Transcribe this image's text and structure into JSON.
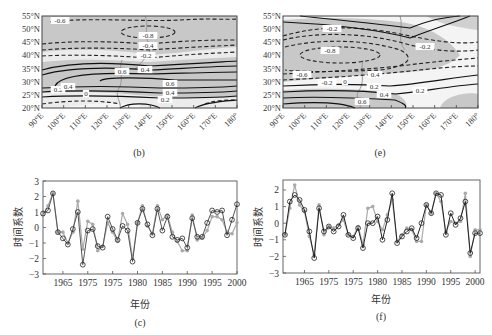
{
  "panels": {
    "b": {
      "caption": "(b)",
      "frame": {
        "x": 42,
        "y": 16,
        "w": 195,
        "h": 92
      },
      "lat_ticks": [
        "55°N",
        "50°N",
        "45°N",
        "40°N",
        "35°N",
        "30°N",
        "25°N",
        "20°N"
      ],
      "lon_ticks": [
        "90°E",
        "100°E",
        "110°E",
        "120°E",
        "130°E",
        "140°E",
        "150°E",
        "160°E",
        "170°E",
        "180°"
      ],
      "contour_labels": [
        {
          "text": "-0.6",
          "x": 60,
          "y": 22
        },
        {
          "text": "-0.8",
          "x": 148,
          "y": 37
        },
        {
          "text": "-0.4",
          "x": 148,
          "y": 47
        },
        {
          "text": "-0.2",
          "x": 146,
          "y": 57
        },
        {
          "text": "0.6",
          "x": 122,
          "y": 73
        },
        {
          "text": "0.4",
          "x": 145,
          "y": 71
        },
        {
          "text": "0.6",
          "x": 170,
          "y": 85
        },
        {
          "text": "0.4",
          "x": 170,
          "y": 94
        },
        {
          "text": "0.2",
          "x": 165,
          "y": 101
        },
        {
          "text": "0.2",
          "x": 58,
          "y": 91
        },
        {
          "text": "0.4",
          "x": 68,
          "y": 88
        },
        {
          "text": "0",
          "x": 86,
          "y": 95
        }
      ]
    },
    "e": {
      "caption": "(e)",
      "frame": {
        "x": 283,
        "y": 16,
        "w": 195,
        "h": 92
      },
      "lat_ticks": [
        "55°N",
        "50°N",
        "45°N",
        "40°N",
        "35°N",
        "30°N",
        "25°N",
        "20°N"
      ],
      "lon_ticks": [
        "90°E",
        "100°E",
        "110°E",
        "120°E",
        "130°E",
        "140°E",
        "150°E",
        "160°E",
        "170°E",
        "180°"
      ],
      "contour_labels": [
        {
          "text": "-0.2",
          "x": 332,
          "y": 30
        },
        {
          "text": "-0.2",
          "x": 425,
          "y": 48
        },
        {
          "text": "-0.8",
          "x": 330,
          "y": 52
        },
        {
          "text": "-0.6",
          "x": 302,
          "y": 76
        },
        {
          "text": "-0.2",
          "x": 327,
          "y": 84
        },
        {
          "text": "0",
          "x": 345,
          "y": 83
        },
        {
          "text": "0.4",
          "x": 375,
          "y": 76
        },
        {
          "text": "0.2",
          "x": 374,
          "y": 88
        },
        {
          "text": "0.4",
          "x": 384,
          "y": 96
        },
        {
          "text": "0.2",
          "x": 420,
          "y": 92
        },
        {
          "text": "0.6",
          "x": 362,
          "y": 103
        }
      ]
    },
    "c": {
      "caption": "(c)",
      "ylabel": "时间系数",
      "xlabel": "年份",
      "frame": {
        "x": 43,
        "y": 181,
        "w": 194,
        "h": 93
      },
      "xtick_labels": [
        "1965",
        "1975",
        "1975",
        "1980",
        "1985",
        "1990",
        "1995",
        "2000"
      ],
      "ytick_labels": [
        "3",
        "2",
        "1",
        "0",
        "−1",
        "−2",
        "−3"
      ]
    },
    "f": {
      "caption": "(f)",
      "ylabel": "时间系数",
      "xlabel": "年份",
      "frame": {
        "x": 283,
        "y": 180,
        "w": 197,
        "h": 93
      },
      "xtick_labels": [
        "1965",
        "1975",
        "1975",
        "1980",
        "1985",
        "1990",
        "1995",
        "2000"
      ],
      "ytick_labels": [
        "2",
        "1",
        "0",
        "−1",
        "−2",
        "−3"
      ]
    }
  },
  "chart_data": [
    {
      "type": "contour-map",
      "panel": "b",
      "title": "(b)",
      "xlabel": "",
      "ylabel": "",
      "x_range": [
        "90°E",
        "180°"
      ],
      "y_range": [
        "20°N",
        "55°N"
      ],
      "contour_levels": [
        -0.8,
        -0.6,
        -0.4,
        -0.2,
        0,
        0.2,
        0.4,
        0.6
      ],
      "notes": "Negative dashed contours north of ~40°N (min -0.8 near 130°E,50°N); positive solid contours band 25–35°N (max 0.6); shading marks significant regions"
    },
    {
      "type": "contour-map",
      "panel": "e",
      "title": "(e)",
      "x_range": [
        "90°E",
        "180°"
      ],
      "y_range": [
        "20°N",
        "55°N"
      ],
      "contour_levels": [
        -0.8,
        -0.6,
        -0.4,
        -0.2,
        0,
        0.2,
        0.4,
        0.6
      ],
      "notes": "Negative dashed centre -0.8 near 110°E,38°N; positive solid contours south of 30°N (0.2–0.6); shaded significant areas"
    },
    {
      "type": "line",
      "panel": "c",
      "title": "(c)",
      "xlabel": "年份",
      "ylabel": "时间系数",
      "xtick_labels": [
        "1965",
        "1975",
        "1975",
        "1980",
        "1985",
        "1990",
        "1995",
        "2000"
      ],
      "ylim": [
        -3,
        3
      ],
      "x": [
        1961,
        1962,
        1963,
        1964,
        1965,
        1966,
        1967,
        1968,
        1969,
        1970,
        1971,
        1972,
        1973,
        1974,
        1975,
        1976,
        1977,
        1978,
        1979,
        1980,
        1981,
        1982,
        1983,
        1984,
        1985,
        1986,
        1987,
        1988,
        1989,
        1990,
        1991,
        1992,
        1993,
        1994,
        1995,
        1996,
        1997,
        1998,
        1999,
        2000
      ],
      "series": [
        {
          "name": "black-open-circles",
          "values": [
            0.9,
            1.1,
            2.2,
            -0.3,
            -0.7,
            -1.1,
            -0.1,
            1.0,
            -2.4,
            -0.2,
            -0.1,
            -1.2,
            -1.3,
            0.7,
            -0.1,
            -0.8,
            0.1,
            -0.2,
            -2.2,
            0.3,
            1.2,
            0.2,
            -0.5,
            1.2,
            -0.2,
            0.7,
            -0.6,
            -0.8,
            -0.7,
            -1.3,
            0.6,
            -0.6,
            -0.6,
            0.3,
            1.1,
            1.0,
            1.1,
            -0.5,
            0.5,
            1.5
          ]
        },
        {
          "name": "gray-filled-circles",
          "values": [
            0.8,
            1.4,
            2.2,
            -0.3,
            -0.3,
            -1.0,
            -0.3,
            1.7,
            -1.4,
            0.4,
            0.2,
            -1.5,
            -1.2,
            0.3,
            -0.3,
            -0.9,
            0.9,
            0.2,
            -2.0,
            0.3,
            1.4,
            0.1,
            -0.4,
            1.4,
            0.5,
            0.8,
            -0.3,
            -0.9,
            -1.5,
            -1.5,
            0.8,
            -0.8,
            -0.7,
            -0.2,
            0.7,
            0.7,
            0.5,
            -0.3,
            -0.4,
            0.3
          ]
        }
      ]
    },
    {
      "type": "line",
      "panel": "f",
      "title": "(f)",
      "xlabel": "年份",
      "ylabel": "时间系数",
      "xtick_labels": [
        "1965",
        "1975",
        "1975",
        "1980",
        "1985",
        "1990",
        "1995",
        "2000"
      ],
      "ylim": [
        -3,
        2.6
      ],
      "x": [
        1961,
        1962,
        1963,
        1964,
        1965,
        1966,
        1967,
        1968,
        1969,
        1970,
        1971,
        1972,
        1973,
        1974,
        1975,
        1976,
        1977,
        1978,
        1979,
        1980,
        1981,
        1982,
        1983,
        1984,
        1985,
        1986,
        1987,
        1988,
        1989,
        1990,
        1991,
        1992,
        1993,
        1994,
        1995,
        1996,
        1997,
        1998,
        1999,
        2000,
        2001
      ],
      "series": [
        {
          "name": "black-open-circles",
          "values": [
            -0.7,
            1.3,
            1.7,
            1.4,
            0.8,
            -0.5,
            -2.1,
            0.9,
            -0.5,
            -0.2,
            -0.5,
            -0.2,
            0.5,
            -0.7,
            -0.9,
            -0.3,
            -1.5,
            0.0,
            0.0,
            0.4,
            -1.0,
            0.2,
            1.8,
            -1.2,
            -0.8,
            -0.5,
            -0.3,
            -0.9,
            0.0,
            1.1,
            0.6,
            1.8,
            1.7,
            -0.7,
            0.6,
            -0.1,
            0.3,
            1.3,
            -1.8,
            -0.6,
            -0.6
          ]
        },
        {
          "name": "gray-filled-circles",
          "values": [
            -0.7,
            0.9,
            2.3,
            1.1,
            0.7,
            -0.8,
            -1.9,
            1.1,
            -0.7,
            -0.2,
            -0.3,
            -0.1,
            0.2,
            -0.7,
            -0.8,
            -0.2,
            -1.3,
            0.9,
            1.0,
            0.1,
            -0.4,
            0.5,
            1.4,
            -1.1,
            -0.7,
            -0.3,
            -0.4,
            -1.1,
            -1.1,
            1.1,
            0.6,
            1.8,
            1.3,
            -0.5,
            0.1,
            0.0,
            0.1,
            1.8,
            -2.0,
            -0.4,
            -0.4
          ]
        }
      ]
    }
  ]
}
